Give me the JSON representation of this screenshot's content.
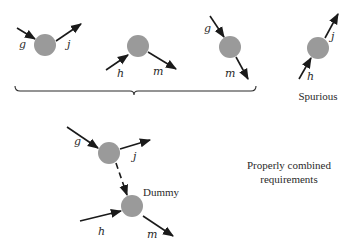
{
  "colors": {
    "node": "#9a9a9a",
    "edge": "#1a1a1a",
    "text": "#2a2a2a",
    "background": "#ffffff"
  },
  "diagrams": [
    {
      "id": "req-gj",
      "node": {
        "cx": 45,
        "cy": 45,
        "r": 11
      },
      "edges": [
        {
          "label": "g",
          "x1": 17,
          "y1": 28,
          "x2": 35,
          "y2": 39,
          "lx": 19,
          "ly": 48
        },
        {
          "label": "j",
          "x1": 56,
          "y1": 41,
          "x2": 81,
          "y2": 24,
          "lx": 67,
          "ly": 48
        }
      ]
    },
    {
      "id": "req-hm",
      "node": {
        "cx": 138,
        "cy": 46,
        "r": 11
      },
      "edges": [
        {
          "label": "h",
          "x1": 106,
          "y1": 70,
          "x2": 128,
          "y2": 55,
          "lx": 117,
          "ly": 77
        },
        {
          "label": "m",
          "x1": 148,
          "y1": 52,
          "x2": 176,
          "y2": 69,
          "lx": 153,
          "ly": 75
        }
      ]
    },
    {
      "id": "req-gm",
      "node": {
        "cx": 230,
        "cy": 47,
        "r": 11
      },
      "edges": [
        {
          "label": "g",
          "x1": 210,
          "y1": 16,
          "x2": 224,
          "y2": 37,
          "lx": 204,
          "ly": 32
        },
        {
          "label": "m",
          "x1": 236,
          "y1": 57,
          "x2": 248,
          "y2": 79,
          "lx": 225,
          "ly": 77
        }
      ]
    },
    {
      "id": "spurious-hj",
      "node": {
        "cx": 318,
        "cy": 48,
        "r": 11
      },
      "edges": [
        {
          "label": "h",
          "x1": 299,
          "y1": 79,
          "x2": 311,
          "y2": 58,
          "lx": 307,
          "ly": 80
        },
        {
          "label": "j",
          "x1": 325,
          "y1": 38,
          "x2": 338,
          "y2": 14,
          "lx": 331,
          "ly": 40
        }
      ],
      "caption": "Spurious"
    }
  ],
  "brace": {
    "x1": 15,
    "x2": 256,
    "y": 91,
    "tip": 134
  },
  "combined": {
    "top_node": {
      "cx": 109,
      "cy": 153,
      "r": 11
    },
    "bottom_node": {
      "cx": 132,
      "cy": 206,
      "r": 11
    },
    "edges": [
      {
        "label": "g",
        "x1": 67,
        "y1": 127,
        "x2": 98,
        "y2": 148,
        "lx": 74,
        "ly": 145
      },
      {
        "label": "j",
        "x1": 120,
        "y1": 149,
        "x2": 150,
        "y2": 140,
        "lx": 133,
        "ly": 160
      },
      {
        "label": "h",
        "x1": 80,
        "y1": 221,
        "x2": 121,
        "y2": 211,
        "lx": 98,
        "ly": 235
      },
      {
        "label": "m",
        "x1": 143,
        "y1": 216,
        "x2": 173,
        "y2": 236,
        "lx": 147,
        "ly": 238
      }
    ],
    "dummy_edge": {
      "x1": 116,
      "y1": 163,
      "x2": 127,
      "y2": 195
    },
    "dummy_label": "Dummy",
    "caption_line1": "Properly combined",
    "caption_line2": "requirements"
  }
}
